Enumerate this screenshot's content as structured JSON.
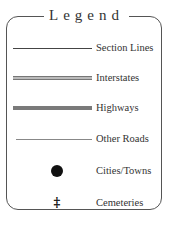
{
  "legend": {
    "title": "Legend",
    "items": [
      {
        "label": "Section Lines",
        "symbol": "thin-solid-line",
        "color": "#444444"
      },
      {
        "label": "Interstates",
        "symbol": "double-line",
        "color": "#777777"
      },
      {
        "label": "Highways",
        "symbol": "thick-gray-line",
        "color": "#7a7a7a"
      },
      {
        "label": "Other Roads",
        "symbol": "thin-gray-line",
        "color": "#888888"
      },
      {
        "label": "Cities/Towns",
        "symbol": "black-dot",
        "color": "#111111"
      },
      {
        "label": "Cemeteries",
        "symbol": "cross-glyph",
        "glyph": "‡",
        "color": "#111111"
      }
    ]
  }
}
